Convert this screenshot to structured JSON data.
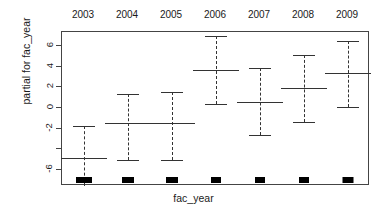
{
  "chart_data": {
    "type": "scatter",
    "title": "",
    "xlabel": "fac_year",
    "ylabel": "partial for fac_year",
    "categories": [
      "2003",
      "2004",
      "2005",
      "2006",
      "2007",
      "2008",
      "2009"
    ],
    "ylim": [
      -7.6,
      7.4
    ],
    "yticks": [
      6,
      4,
      2,
      0,
      -2,
      -4,
      -6
    ],
    "ytick_labels": [
      "6",
      "4",
      "2",
      "0",
      "-2",
      "",
      "-6"
    ],
    "grid": false,
    "legend": null,
    "series": [
      {
        "name": "partial effect",
        "values": [
          -4.9,
          -1.5,
          -1.5,
          3.7,
          0.55,
          1.9,
          3.4
        ]
      },
      {
        "name": "upper confidence limit",
        "values": [
          -1.8,
          1.4,
          1.6,
          7.0,
          3.9,
          5.2,
          6.5
        ]
      },
      {
        "name": "lower confidence limit",
        "values": [
          -7.9,
          -5.1,
          -5.1,
          0.4,
          -2.6,
          -1.4,
          0.1
        ]
      }
    ],
    "rug_widths": [
      16,
      12,
      12,
      10,
      10,
      10,
      11
    ],
    "annotations": []
  },
  "axis": {
    "x_title": "fac_year",
    "y_title": "partial for fac_year"
  }
}
